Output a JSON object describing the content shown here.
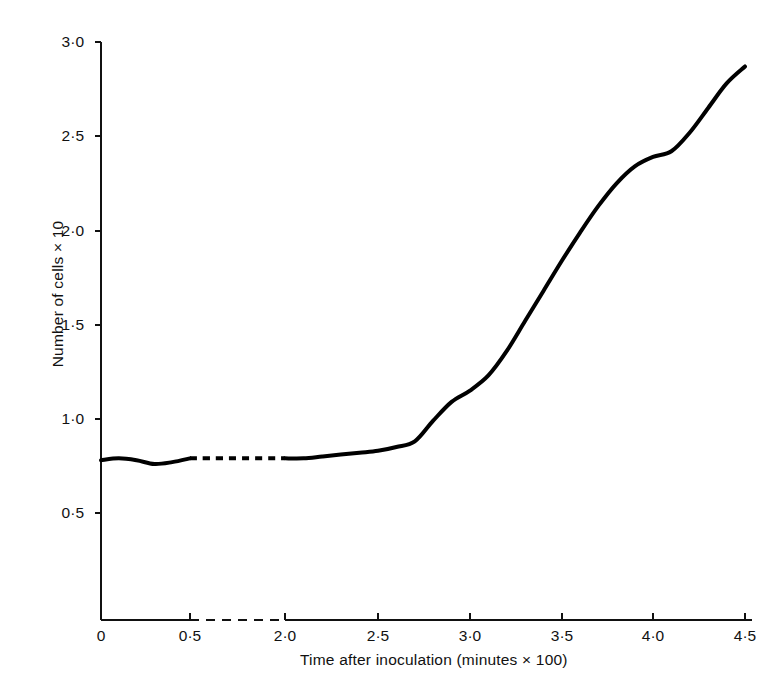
{
  "figure": {
    "background_color": "#ffffff",
    "line_color": "#000000"
  },
  "chart_data": {
    "type": "line",
    "title": "",
    "subtitle": "",
    "xlabel": "Time after inoculation (minutes × 100)",
    "ylabel": "Number of cells × 10",
    "grid": false,
    "legend": null,
    "axis_break": {
      "axis": "x",
      "between": [
        0.5,
        2.0
      ],
      "style": "dashed",
      "note": "x-axis line and data line are dashed between 0·5 and 2·0"
    },
    "xlim": [
      0,
      4.5
    ],
    "ylim": [
      0.25,
      3.0
    ],
    "xticks": [
      0,
      0.5,
      2.0,
      2.5,
      3.0,
      3.5,
      4.0,
      4.5
    ],
    "xtick_labels": [
      "0",
      "0·5",
      "2·0",
      "2·5",
      "3·0",
      "3·5",
      "4·0",
      "4·5"
    ],
    "yticks": [
      0.5,
      1.0,
      1.5,
      2.0,
      2.5,
      3.0
    ],
    "ytick_labels": [
      "0·5",
      "1·0",
      "1·5",
      "2·0",
      "2·5",
      "3·0"
    ],
    "series": [
      {
        "name": "Number of cells",
        "style": "solid-with-dashed-break",
        "x": [
          0.0,
          0.1,
          0.2,
          0.3,
          0.4,
          0.5,
          2.0,
          2.1,
          2.2,
          2.3,
          2.4,
          2.5,
          2.6,
          2.7,
          2.8,
          2.9,
          3.0,
          3.1,
          3.2,
          3.3,
          3.4,
          3.5,
          3.6,
          3.7,
          3.8,
          3.9,
          4.0,
          4.1,
          4.2,
          4.3,
          4.4,
          4.5
        ],
        "y": [
          0.78,
          0.79,
          0.78,
          0.76,
          0.77,
          0.79,
          0.79,
          0.79,
          0.8,
          0.81,
          0.82,
          0.83,
          0.85,
          0.88,
          0.99,
          1.09,
          1.15,
          1.23,
          1.36,
          1.52,
          1.68,
          1.84,
          1.99,
          2.13,
          2.25,
          2.34,
          2.39,
          2.42,
          2.52,
          2.65,
          2.78,
          2.87
        ]
      }
    ]
  }
}
